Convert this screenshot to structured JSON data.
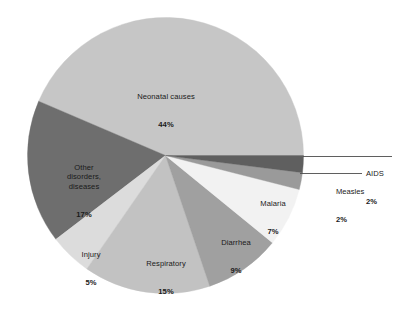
{
  "chart_data": {
    "type": "pie",
    "title": "",
    "subtitle": "",
    "legend_position": "none",
    "grid": false,
    "units": "percent",
    "total": 101,
    "start_angle_deg": 0,
    "direction": "counterclockwise",
    "categories": [
      "Neonatal causes",
      "Other disorders, diseases",
      "Injury",
      "Respiratory",
      "Diarrhea",
      "Malaria",
      "Measles",
      "AIDS"
    ],
    "values": [
      44,
      17,
      5,
      15,
      9,
      7,
      2,
      2
    ],
    "labels": [
      "44%",
      "17%",
      "5%",
      "15%",
      "9%",
      "7%",
      "2%",
      "2%"
    ],
    "colors": [
      "#c6c6c6",
      "#6e6e6e",
      "#dcdcdc",
      "#c2c2c2",
      "#a0a0a0",
      "#f2f2f2",
      "#9a9a9a",
      "#5f5f5f"
    ],
    "slices": [
      {
        "name": "Neonatal causes",
        "value": 44,
        "label": "44%",
        "color": "#c6c6c6",
        "callout": false
      },
      {
        "name": "Other disorders, diseases",
        "value": 17,
        "label": "17%",
        "color": "#6e6e6e",
        "callout": false
      },
      {
        "name": "Injury",
        "value": 5,
        "label": "5%",
        "color": "#dcdcdc",
        "callout": false
      },
      {
        "name": "Respiratory",
        "value": 15,
        "label": "15%",
        "color": "#c2c2c2",
        "callout": false
      },
      {
        "name": "Diarrhea",
        "value": 9,
        "label": "9%",
        "color": "#a0a0a0",
        "callout": false
      },
      {
        "name": "Malaria",
        "value": 7,
        "label": "7%",
        "color": "#f2f2f2",
        "callout": false
      },
      {
        "name": "Measles",
        "value": 2,
        "label": "2%",
        "color": "#9a9a9a",
        "callout": true
      },
      {
        "name": "AIDS",
        "value": 2,
        "label": "2%",
        "color": "#5f5f5f",
        "callout": true
      }
    ]
  },
  "labels": {
    "neonatal": {
      "name": "Neonatal causes",
      "pct": "44%"
    },
    "other": {
      "name": "Other\ndisorders,\ndiseases",
      "pct": "17%"
    },
    "injury": {
      "name": "Injury",
      "pct": "5%"
    },
    "resp": {
      "name": "Respiratory",
      "pct": "15%"
    },
    "diarrhea": {
      "name": "Diarrhea",
      "pct": "9%"
    },
    "malaria": {
      "name": "Malaria",
      "pct": "7%"
    },
    "measles": {
      "name": "Measles",
      "pct": "2%"
    },
    "aids": {
      "name": "AIDS",
      "pct": "2%"
    }
  },
  "style": {
    "background": "#ffffff",
    "text_color": "#1a1a1a",
    "leader_line_color": "#4d4d4d"
  }
}
